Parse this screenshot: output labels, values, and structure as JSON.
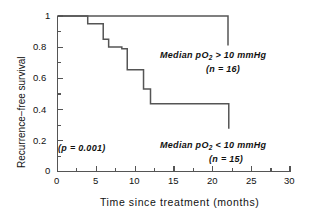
{
  "chart_data": {
    "type": "line",
    "subtype": "kaplan-meier-step",
    "title": "",
    "xlabel": "Time since treatment (months)",
    "ylabel": "Recurrence−free survival",
    "xlim": [
      0,
      30
    ],
    "ylim": [
      0,
      1
    ],
    "xticks": [
      0,
      5,
      10,
      15,
      20,
      25,
      30
    ],
    "xticklabels": [
      "0",
      "5",
      "10",
      "15",
      "20",
      "25",
      "30"
    ],
    "xminorticks": [
      2.5,
      7.5,
      12.5,
      17.5,
      22.5,
      27.5
    ],
    "yticks": [
      0,
      0.2,
      0.4,
      0.6,
      0.8,
      1
    ],
    "yticklabels": [
      "0",
      "0.2",
      "0.4",
      "0.6",
      "0.8",
      "1"
    ],
    "yminorticks": [
      0.1,
      0.3,
      0.5,
      0.7,
      0.9
    ],
    "grid": false,
    "legend": "none",
    "line_color": "#555555",
    "axis_color": "#555555",
    "series": [
      {
        "name": "Median pO2 > 10 mmHg",
        "n": 16,
        "x": [
          0,
          22,
          22
        ],
        "y": [
          1.0,
          1.0,
          0.81
        ],
        "comment": "flat at 1.0 until month 22, then censored drop"
      },
      {
        "name": "Median pO2 < 10 mmHg",
        "n": 15,
        "x": [
          0,
          3.9,
          3.9,
          5.9,
          5.9,
          6.6,
          6.6,
          8.3,
          8.3,
          9.0,
          9.0,
          11.1,
          11.1,
          12.0,
          12.0,
          22.1,
          22.1
        ],
        "y": [
          1.0,
          1.0,
          0.95,
          0.95,
          0.85,
          0.85,
          0.8,
          0.8,
          0.79,
          0.79,
          0.655,
          0.655,
          0.53,
          0.53,
          0.435,
          0.435,
          0.275
        ],
        "comment": "stepwise declining recurrence-free survival"
      }
    ],
    "annotations": [
      {
        "id": "upper_group",
        "text": "Median pO",
        "sub": "2",
        "tail": " > 10 mmHg"
      },
      {
        "id": "upper_n",
        "text": "(n = 16)"
      },
      {
        "id": "lower_group",
        "text": "Median pO",
        "sub": "2",
        "tail": " < 10 mmHg"
      },
      {
        "id": "lower_n",
        "text": "(n = 15)"
      },
      {
        "id": "pvalue",
        "text": "(p = 0.001)"
      }
    ]
  },
  "annotations": {
    "upper_group_prefix": "Median pO",
    "upper_group_sub": "2",
    "upper_group_suffix": " > 10 mmHg",
    "upper_n": "(n = 16)",
    "lower_group_prefix": "Median pO",
    "lower_group_sub": "2",
    "lower_group_suffix": " < 10 mmHg",
    "lower_n": "(n = 15)",
    "pvalue": "(p = 0.001)"
  },
  "axes": {
    "xlabel": "Time since treatment (months)",
    "ylabel": "Recurrence−free survival",
    "xticklabels": [
      "0",
      "5",
      "10",
      "15",
      "20",
      "25",
      "30"
    ],
    "yticklabels": [
      "1",
      "0.8",
      "0.6",
      "0.4",
      "0.2",
      "0"
    ]
  }
}
